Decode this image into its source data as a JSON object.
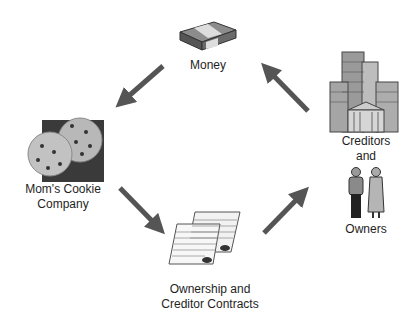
{
  "diagram": {
    "type": "cycle",
    "nodes": {
      "money": {
        "label": "Money",
        "icon": "money-stack-icon"
      },
      "company": {
        "label_line1": "Mom's Cookie",
        "label_line2": "Company",
        "icon": "cookies-icon"
      },
      "contracts": {
        "label_line1": "Ownership and",
        "label_line2": "Creditor Contracts",
        "icon": "contracts-icon"
      },
      "creditors": {
        "label_line1": "Creditors",
        "label_line2": "and",
        "icon": "buildings-icon"
      },
      "owners": {
        "label": "Owners",
        "icon": "people-icon"
      }
    },
    "edges": [
      {
        "from": "Money",
        "to": "Mom's Cookie Company"
      },
      {
        "from": "Mom's Cookie Company",
        "to": "Ownership and Creditor Contracts"
      },
      {
        "from": "Ownership and Creditor Contracts",
        "to": "Creditors and Owners"
      },
      {
        "from": "Creditors and Owners",
        "to": "Money"
      }
    ],
    "colors": {
      "arrow": "#555555",
      "text": "#1e1e1e"
    }
  }
}
